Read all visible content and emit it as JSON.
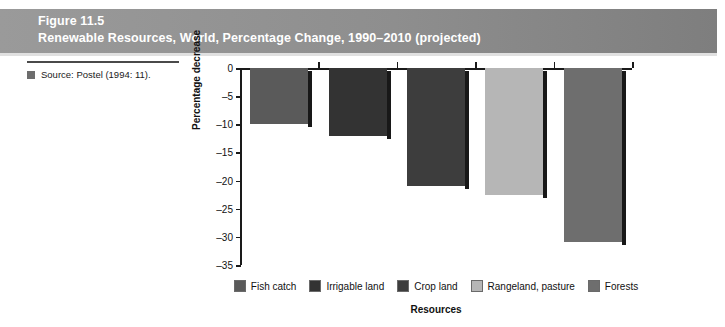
{
  "figure": {
    "number": "Figure 11.5",
    "title": "Renewable Resources, World, Percentage Change, 1990–2010 (projected)"
  },
  "source": {
    "text": "Source: Postel (1994: 11).",
    "bullet_icon": "square-bullet-icon"
  },
  "chart_data": {
    "type": "bar",
    "title": "Renewable Resources, World, Percentage Change, 1990–2010 (projected)",
    "categories": [
      "Fish catch",
      "Irrigable land",
      "Crop land",
      "Rangeland, pasture",
      "Forests"
    ],
    "values": [
      -10,
      -12,
      -21,
      -22.5,
      -31
    ],
    "xlabel": "Resources",
    "ylabel": "Percentage decrease",
    "ylim": [
      -35,
      0
    ],
    "yticks": [
      0,
      -5,
      -10,
      -15,
      -20,
      -25,
      -30,
      -35
    ],
    "ytick_labels": [
      "0",
      "–5",
      "–10",
      "–15",
      "–20",
      "–25",
      "–30",
      "–35"
    ],
    "grid": false,
    "legend_position": "bottom",
    "series_colors": [
      "#5a5a5a",
      "#333333",
      "#3d3d3d",
      "#b6b6b6",
      "#6e6e6e"
    ]
  }
}
